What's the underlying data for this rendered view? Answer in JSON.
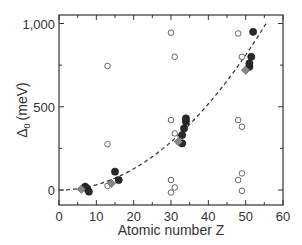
{
  "chart_data": {
    "type": "scatter",
    "title": "",
    "xlabel": "Atomic number Z",
    "ylabel": "Δ0 (meV)",
    "ylabel_main": "Δ",
    "ylabel_sub": "0",
    "ylabel_unit": "(meV)",
    "xlim": [
      0,
      60
    ],
    "ylim": [
      -120,
      1030
    ],
    "xticks": [
      0,
      10,
      20,
      30,
      40,
      50,
      60
    ],
    "xtick_labels": [
      "0",
      "10",
      "20",
      "30",
      "40",
      "50",
      "60"
    ],
    "yticks": [
      0,
      500,
      1000
    ],
    "ytick_labels": [
      "0",
      "500",
      "1,000"
    ],
    "grid": false,
    "legend": null,
    "series": [
      {
        "name": "open circles",
        "marker": "open-circle",
        "color": "#555555",
        "points": [
          {
            "x": 13,
            "y": 745
          },
          {
            "x": 13,
            "y": 275
          },
          {
            "x": 13,
            "y": 25
          },
          {
            "x": 30,
            "y": 945
          },
          {
            "x": 31,
            "y": 800
          },
          {
            "x": 30,
            "y": 420
          },
          {
            "x": 31,
            "y": 340
          },
          {
            "x": 30,
            "y": 60
          },
          {
            "x": 31,
            "y": 15
          },
          {
            "x": 30,
            "y": -15
          },
          {
            "x": 48,
            "y": 940
          },
          {
            "x": 49,
            "y": 800
          },
          {
            "x": 48,
            "y": 420
          },
          {
            "x": 49,
            "y": 380
          },
          {
            "x": 49,
            "y": 100
          },
          {
            "x": 48,
            "y": 60
          },
          {
            "x": 49,
            "y": -5
          }
        ]
      },
      {
        "name": "filled circles",
        "marker": "filled-circle",
        "color": "#2a2a2a",
        "points": [
          {
            "x": 7,
            "y": 20
          },
          {
            "x": 7.5,
            "y": 10
          },
          {
            "x": 8,
            "y": -10
          },
          {
            "x": 15,
            "y": 110
          },
          {
            "x": 16,
            "y": 60
          },
          {
            "x": 33,
            "y": 280
          },
          {
            "x": 33,
            "y": 330
          },
          {
            "x": 33.5,
            "y": 370
          },
          {
            "x": 34,
            "y": 410
          },
          {
            "x": 34,
            "y": 430
          },
          {
            "x": 51,
            "y": 740
          },
          {
            "x": 51,
            "y": 760
          },
          {
            "x": 51.5,
            "y": 800
          },
          {
            "x": 52,
            "y": 950
          }
        ]
      },
      {
        "name": "grey diamonds",
        "marker": "diamond",
        "color": "#888888",
        "points": [
          {
            "x": 6,
            "y": 5
          },
          {
            "x": 14,
            "y": 40
          },
          {
            "x": 32,
            "y": 290
          },
          {
            "x": 50,
            "y": 720
          }
        ]
      }
    ],
    "fit_curve": {
      "style": "dashed",
      "color": "#333333",
      "x": [
        0,
        5,
        10,
        15,
        20,
        25,
        30,
        35,
        40,
        45,
        50,
        55
      ],
      "y": [
        0,
        8,
        30,
        68,
        120,
        188,
        270,
        368,
        481,
        608,
        751,
        1000
      ]
    }
  }
}
